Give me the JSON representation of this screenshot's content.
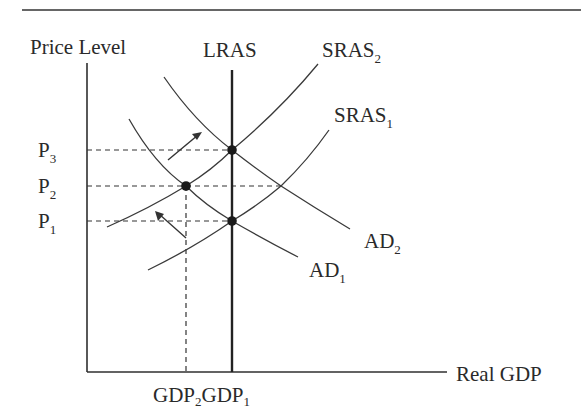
{
  "diagram": {
    "type": "AD-AS model",
    "axes": {
      "y_label": "Price Level",
      "x_label": "Real GDP"
    },
    "curves": {
      "lras": "LRAS",
      "sras2": {
        "base": "SRAS",
        "sub": "2"
      },
      "sras1": {
        "base": "SRAS",
        "sub": "1"
      },
      "ad2": {
        "base": "AD",
        "sub": "2"
      },
      "ad1": {
        "base": "AD",
        "sub": "1"
      }
    },
    "price_levels": [
      {
        "base": "P",
        "sub": "3"
      },
      {
        "base": "P",
        "sub": "2"
      },
      {
        "base": "P",
        "sub": "1"
      }
    ],
    "output_levels": [
      {
        "base": "GDP",
        "sub": "2"
      },
      {
        "base": "GDP",
        "sub": "1"
      }
    ],
    "equilibria": [
      {
        "name": "P3 at GDP1 (AD2 ∩ SRAS2 on LRAS)"
      },
      {
        "name": "P2 at GDP2 (AD1 ∩ SRAS2)"
      },
      {
        "name": "P1 at GDP1 (AD1 ∩ SRAS1 on LRAS)"
      }
    ],
    "arrows": [
      {
        "name": "AD shift right (AD1 → AD2)"
      },
      {
        "name": "SRAS shift left (SRAS1 → SRAS2)"
      }
    ]
  }
}
